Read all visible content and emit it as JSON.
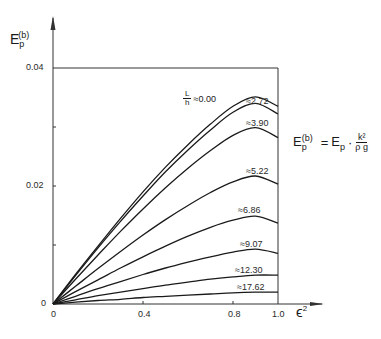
{
  "chart_data": {
    "type": "line",
    "title": "",
    "ylabel": "E_p^(b)",
    "xlabel": "ε²",
    "xlim": [
      0,
      1.0
    ],
    "ylim": [
      0,
      0.04
    ],
    "x_ticks": [
      "0",
      "0.4",
      "0.8",
      "1.0"
    ],
    "y_ticks": [
      "0",
      "0.02",
      "0.04"
    ],
    "grid": false,
    "legend_position": "inline labels near curve peaks",
    "annotation": "E_p^(b) = E_p · k² / (ρ g)",
    "parameter_label": "L/h",
    "x": [
      0,
      0.1,
      0.2,
      0.3,
      0.4,
      0.5,
      0.6,
      0.7,
      0.8,
      0.9,
      1.0
    ],
    "series": [
      {
        "name": "L/h ≈ 0.00",
        "label": "≈0.00",
        "values": [
          0,
          0.005,
          0.0098,
          0.0145,
          0.019,
          0.0232,
          0.027,
          0.0305,
          0.0335,
          0.0351,
          0.0335
        ]
      },
      {
        "name": "L/h ≈ 2.72",
        "label": "≈2.72",
        "values": [
          0,
          0.0048,
          0.0095,
          0.014,
          0.0183,
          0.0224,
          0.0261,
          0.0295,
          0.0325,
          0.034,
          0.0322
        ]
      },
      {
        "name": "L/h ≈ 3.90",
        "label": "≈3.90",
        "values": [
          0,
          0.0042,
          0.0083,
          0.0123,
          0.0161,
          0.0197,
          0.023,
          0.026,
          0.0286,
          0.0299,
          0.0282
        ]
      },
      {
        "name": "L/h ≈ 5.22",
        "label": "≈5.22",
        "values": [
          0,
          0.003,
          0.006,
          0.0089,
          0.0117,
          0.0143,
          0.0167,
          0.0189,
          0.0207,
          0.0217,
          0.0203
        ]
      },
      {
        "name": "L/h ≈ 6.86",
        "label": "≈6.86",
        "values": [
          0,
          0.0021,
          0.0041,
          0.0061,
          0.008,
          0.0098,
          0.0115,
          0.013,
          0.0142,
          0.0149,
          0.0137
        ]
      },
      {
        "name": "L/h ≈ 9.07",
        "label": "≈9.07",
        "values": [
          0,
          0.0013,
          0.0026,
          0.0038,
          0.005,
          0.0061,
          0.0071,
          0.008,
          0.0088,
          0.0093,
          0.0086
        ]
      },
      {
        "name": "L/h ≈ 12.30",
        "label": "≈12.30",
        "values": [
          0,
          0.0007,
          0.0014,
          0.002,
          0.0026,
          0.0032,
          0.0037,
          0.0042,
          0.0046,
          0.0049,
          0.0049
        ]
      },
      {
        "name": "L/h ≈ 17.62",
        "label": "≈17.62",
        "values": [
          0,
          0.0003,
          0.0006,
          0.0008,
          0.0011,
          0.0013,
          0.0015,
          0.0017,
          0.0019,
          0.002,
          0.002
        ]
      }
    ]
  },
  "axes": {
    "y_label_main": "E",
    "y_label_sub": "p",
    "y_label_sup": "(b)",
    "x_label_main": "ϵ",
    "x_label_sup": "2",
    "y_tick_0": "0",
    "y_tick_002": "0.02",
    "y_tick_004": "0.04",
    "x_tick_0": "0",
    "x_tick_04": "0.4",
    "x_tick_08": "0.8",
    "x_tick_10": "1.0"
  },
  "formula": {
    "lhs_main": "E",
    "lhs_sub": "p",
    "lhs_sup": "(b)",
    "equals": "=",
    "rhs_main": "E",
    "rhs_sub": "p",
    "dot": "·",
    "num": "k²",
    "den": "ρ g"
  },
  "param_label": {
    "num": "L",
    "den": "h",
    "value": "≈0.00"
  },
  "curve_labels": [
    "≈2.72",
    "≈3.90",
    "≈5.22",
    "≈6.86",
    "≈9.07",
    "≈12.30",
    "≈17.62"
  ],
  "colors": {
    "line": "#1a1a1a",
    "axis": "#333333",
    "background": "#ffffff"
  }
}
